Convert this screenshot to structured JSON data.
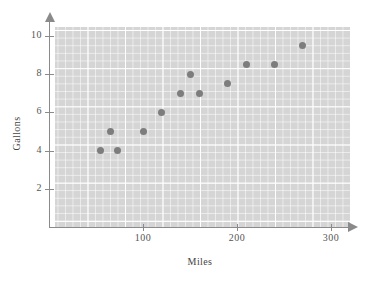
{
  "chart_data": {
    "type": "scatter",
    "title": "",
    "xlabel": "Miles",
    "ylabel": "Gallons",
    "xlim": [
      0,
      320
    ],
    "ylim": [
      0,
      11
    ],
    "xticks": [
      100,
      200,
      300
    ],
    "xtick_labels": [
      "100",
      "200",
      "300"
    ],
    "yticks": [
      2,
      4,
      6,
      8,
      10
    ],
    "ytick_labels": [
      "2",
      "4",
      "6",
      "8",
      "10"
    ],
    "grid": true,
    "legend": null,
    "point_color": "#7d7d7d",
    "panel_color": "#d5d5d5",
    "gridline_color": "#ffffff",
    "axis_color": "#8a8a8a",
    "points": [
      {
        "x": 55,
        "y": 4
      },
      {
        "x": 65,
        "y": 5
      },
      {
        "x": 73,
        "y": 4
      },
      {
        "x": 100,
        "y": 5
      },
      {
        "x": 120,
        "y": 6
      },
      {
        "x": 140,
        "y": 7
      },
      {
        "x": 150,
        "y": 8
      },
      {
        "x": 160,
        "y": 7
      },
      {
        "x": 190,
        "y": 7.5
      },
      {
        "x": 210,
        "y": 8.5
      },
      {
        "x": 240,
        "y": 8.5
      },
      {
        "x": 270,
        "y": 9.5
      }
    ]
  }
}
